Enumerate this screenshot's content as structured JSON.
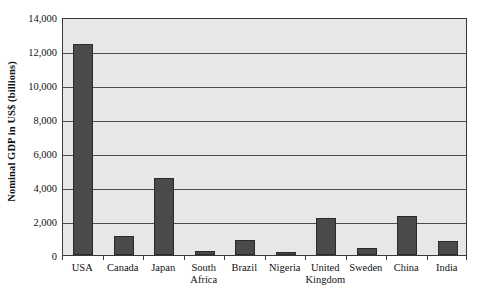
{
  "chart_data": {
    "type": "bar",
    "title": "",
    "xlabel": "",
    "ylabel": "Nominal GDP in US$ (billions)",
    "ylim": [
      0,
      14000
    ],
    "ytick_labels": [
      "14,000",
      "12,000",
      "10,000",
      "8,000",
      "6,000",
      "4,000",
      "2,000",
      "0"
    ],
    "ytick_values": [
      14000,
      12000,
      10000,
      8000,
      6000,
      4000,
      2000,
      0
    ],
    "grid": "horizontal",
    "legend": "none",
    "categories": [
      "USA",
      "Canada",
      "Japan",
      "South Africa",
      "Brazil",
      "Nigeria",
      "United Kingdom",
      "Sweden",
      "China",
      "India"
    ],
    "category_lines": [
      [
        "USA",
        ""
      ],
      [
        "Canada",
        ""
      ],
      [
        "Japan",
        ""
      ],
      [
        "South",
        "Africa"
      ],
      [
        "Brazil",
        ""
      ],
      [
        "Nigeria",
        ""
      ],
      [
        "United",
        "Kingdom"
      ],
      [
        "Sweden",
        ""
      ],
      [
        "China",
        ""
      ],
      [
        "India",
        ""
      ]
    ],
    "values": [
      12400,
      1120,
      4550,
      260,
      860,
      170,
      2200,
      440,
      2280,
      800
    ],
    "colors": {
      "bar_fill": "#4a4a4a",
      "bar_edge": "#2b2b2b",
      "plot_background": "#e7e7e7",
      "gridline": "#4d4d4d",
      "axis": "#3a3a3a",
      "text": "#111111",
      "page_background": "#ffffff"
    }
  }
}
